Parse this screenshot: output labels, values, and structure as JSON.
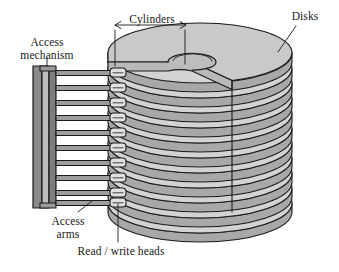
{
  "figure": {
    "background_color": "#ffffff",
    "ink_color": "#1a1a1a"
  },
  "labels": {
    "access_mechanism": "Access\nmechanism",
    "cylinders": "Cylinders",
    "disks": "Disks",
    "access_arms": "Access\narms",
    "read_write_heads": "Read / write heads"
  },
  "components": {
    "disk_count": 11,
    "arm_count": 11,
    "head_count": 11,
    "disk_top_fill": "#c9c9c9",
    "disk_side_fill": "#b4b4b4",
    "disk_face_fill": "#d5d5d5",
    "mechanism_fill": "#8f8f8f",
    "arm_fill": "#9a9a9a",
    "head_fill": "#dcdcdc",
    "outline_color": "#1a1a1a"
  }
}
